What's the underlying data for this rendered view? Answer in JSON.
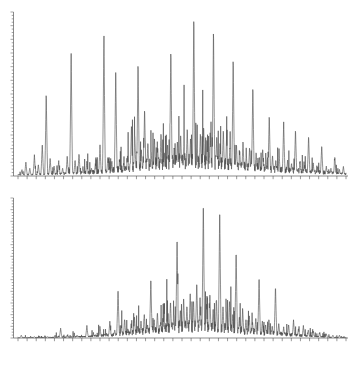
{
  "figure": {
    "kind": "stacked-mass-spectra",
    "panel_count": 2,
    "background_color": "#ffffff",
    "trace_color": "#4a4a4a",
    "axis_color": "#5a5a5a",
    "has_visible_text_labels": false,
    "caption": ""
  },
  "chart_data": [
    {
      "type": "line",
      "id": "top-spectrum",
      "title": "",
      "subtitle": "",
      "xlabel": "",
      "ylabel": "",
      "xlim": [
        0,
        100
      ],
      "ylim": [
        0,
        100
      ],
      "grid": false,
      "legend": [],
      "legend_position": "none",
      "axes": {
        "y_axis": {
          "visible": true,
          "position": "left",
          "style": "ticked-vertical-line",
          "minor_tick_count": 48,
          "tick_labels": []
        },
        "x_axis": {
          "visible": true,
          "position": "bottom",
          "style": "ticked-horizontal-line",
          "major_tick_count": 36,
          "tick_labels": []
        }
      },
      "annotations": [],
      "peaks": [
        {
          "x": 1.2,
          "y": 4
        },
        {
          "x": 2.4,
          "y": 9
        },
        {
          "x": 3.6,
          "y": 5
        },
        {
          "x": 5.0,
          "y": 13
        },
        {
          "x": 6.2,
          "y": 7
        },
        {
          "x": 7.4,
          "y": 20
        },
        {
          "x": 8.6,
          "y": 52
        },
        {
          "x": 9.8,
          "y": 11
        },
        {
          "x": 11.0,
          "y": 6
        },
        {
          "x": 12.4,
          "y": 9
        },
        {
          "x": 13.6,
          "y": 5
        },
        {
          "x": 15.0,
          "y": 12
        },
        {
          "x": 16.2,
          "y": 77
        },
        {
          "x": 17.4,
          "y": 10
        },
        {
          "x": 18.6,
          "y": 14
        },
        {
          "x": 19.8,
          "y": 6
        },
        {
          "x": 21.0,
          "y": 9
        },
        {
          "x": 22.4,
          "y": 5
        },
        {
          "x": 23.6,
          "y": 8
        },
        {
          "x": 25.0,
          "y": 19
        },
        {
          "x": 26.2,
          "y": 88
        },
        {
          "x": 27.4,
          "y": 12
        },
        {
          "x": 28.6,
          "y": 9
        },
        {
          "x": 29.8,
          "y": 65
        },
        {
          "x": 31.0,
          "y": 10
        },
        {
          "x": 32.2,
          "y": 8
        },
        {
          "x": 33.4,
          "y": 13
        },
        {
          "x": 34.6,
          "y": 32
        },
        {
          "x": 35.6,
          "y": 26
        },
        {
          "x": 36.6,
          "y": 71
        },
        {
          "x": 37.6,
          "y": 17
        },
        {
          "x": 38.6,
          "y": 42
        },
        {
          "x": 39.6,
          "y": 21
        },
        {
          "x": 40.6,
          "y": 16
        },
        {
          "x": 41.6,
          "y": 24
        },
        {
          "x": 42.6,
          "y": 18
        },
        {
          "x": 43.6,
          "y": 27
        },
        {
          "x": 44.6,
          "y": 15
        },
        {
          "x": 45.6,
          "y": 20
        },
        {
          "x": 46.6,
          "y": 79
        },
        {
          "x": 47.6,
          "y": 18
        },
        {
          "x": 48.6,
          "y": 22
        },
        {
          "x": 49.6,
          "y": 26
        },
        {
          "x": 50.6,
          "y": 19
        },
        {
          "x": 51.6,
          "y": 30
        },
        {
          "x": 52.6,
          "y": 24
        },
        {
          "x": 53.6,
          "y": 100
        },
        {
          "x": 54.6,
          "y": 22
        },
        {
          "x": 55.6,
          "y": 27
        },
        {
          "x": 56.6,
          "y": 31
        },
        {
          "x": 57.6,
          "y": 23
        },
        {
          "x": 58.6,
          "y": 28
        },
        {
          "x": 59.6,
          "y": 92
        },
        {
          "x": 60.6,
          "y": 25
        },
        {
          "x": 61.6,
          "y": 21
        },
        {
          "x": 62.6,
          "y": 29
        },
        {
          "x": 63.6,
          "y": 24
        },
        {
          "x": 64.6,
          "y": 18
        },
        {
          "x": 65.6,
          "y": 74
        },
        {
          "x": 66.6,
          "y": 20
        },
        {
          "x": 67.6,
          "y": 16
        },
        {
          "x": 68.6,
          "y": 22
        },
        {
          "x": 69.6,
          "y": 14
        },
        {
          "x": 70.6,
          "y": 18
        },
        {
          "x": 71.6,
          "y": 56
        },
        {
          "x": 72.6,
          "y": 15
        },
        {
          "x": 73.6,
          "y": 12
        },
        {
          "x": 74.6,
          "y": 17
        },
        {
          "x": 75.6,
          "y": 11
        },
        {
          "x": 76.6,
          "y": 38
        },
        {
          "x": 77.6,
          "y": 13
        },
        {
          "x": 78.6,
          "y": 10
        },
        {
          "x": 79.6,
          "y": 14
        },
        {
          "x": 81.0,
          "y": 33
        },
        {
          "x": 82.2,
          "y": 10
        },
        {
          "x": 83.4,
          "y": 8
        },
        {
          "x": 84.6,
          "y": 29
        },
        {
          "x": 86.0,
          "y": 9
        },
        {
          "x": 87.4,
          "y": 7
        },
        {
          "x": 88.6,
          "y": 25
        },
        {
          "x": 90.0,
          "y": 8
        },
        {
          "x": 91.4,
          "y": 6
        },
        {
          "x": 92.6,
          "y": 19
        },
        {
          "x": 94.0,
          "y": 6
        },
        {
          "x": 95.4,
          "y": 5
        },
        {
          "x": 96.6,
          "y": 12
        },
        {
          "x": 98.0,
          "y": 4
        },
        {
          "x": 99.2,
          "y": 6
        }
      ],
      "baseline_envelope": [
        {
          "x": 0,
          "y": 1
        },
        {
          "x": 10,
          "y": 2
        },
        {
          "x": 20,
          "y": 3
        },
        {
          "x": 30,
          "y": 6
        },
        {
          "x": 40,
          "y": 11
        },
        {
          "x": 50,
          "y": 14
        },
        {
          "x": 60,
          "y": 13
        },
        {
          "x": 70,
          "y": 9
        },
        {
          "x": 80,
          "y": 6
        },
        {
          "x": 90,
          "y": 4
        },
        {
          "x": 100,
          "y": 2
        }
      ]
    },
    {
      "type": "line",
      "id": "bottom-spectrum",
      "title": "",
      "subtitle": "",
      "xlabel": "",
      "ylabel": "",
      "xlim": [
        0,
        100
      ],
      "ylim": [
        0,
        100
      ],
      "grid": false,
      "legend": [],
      "legend_position": "none",
      "axes": {
        "y_axis": {
          "visible": true,
          "position": "left",
          "style": "ticked-vertical-line",
          "minor_tick_count": 48,
          "tick_labels": []
        },
        "x_axis": {
          "visible": true,
          "position": "bottom",
          "style": "ticked-horizontal-line",
          "major_tick_count": 36,
          "tick_labels": []
        }
      },
      "annotations": [],
      "peaks": [
        {
          "x": 1.0,
          "y": 2
        },
        {
          "x": 5.0,
          "y": 1
        },
        {
          "x": 9.0,
          "y": 1
        },
        {
          "x": 13.0,
          "y": 7
        },
        {
          "x": 15.0,
          "y": 2
        },
        {
          "x": 18.0,
          "y": 2
        },
        {
          "x": 21.0,
          "y": 9
        },
        {
          "x": 23.0,
          "y": 3
        },
        {
          "x": 25.0,
          "y": 8
        },
        {
          "x": 26.5,
          "y": 3
        },
        {
          "x": 28.0,
          "y": 12
        },
        {
          "x": 29.5,
          "y": 6
        },
        {
          "x": 30.5,
          "y": 36
        },
        {
          "x": 31.5,
          "y": 9
        },
        {
          "x": 32.5,
          "y": 14
        },
        {
          "x": 33.5,
          "y": 7
        },
        {
          "x": 34.5,
          "y": 11
        },
        {
          "x": 35.5,
          "y": 16
        },
        {
          "x": 36.5,
          "y": 9
        },
        {
          "x": 37.5,
          "y": 13
        },
        {
          "x": 38.5,
          "y": 18
        },
        {
          "x": 39.5,
          "y": 10
        },
        {
          "x": 40.5,
          "y": 44
        },
        {
          "x": 41.5,
          "y": 14
        },
        {
          "x": 42.5,
          "y": 19
        },
        {
          "x": 43.5,
          "y": 12
        },
        {
          "x": 44.5,
          "y": 22
        },
        {
          "x": 45.5,
          "y": 15
        },
        {
          "x": 46.5,
          "y": 27
        },
        {
          "x": 47.5,
          "y": 18
        },
        {
          "x": 48.5,
          "y": 74
        },
        {
          "x": 49.5,
          "y": 21
        },
        {
          "x": 50.5,
          "y": 30
        },
        {
          "x": 51.5,
          "y": 24
        },
        {
          "x": 52.5,
          "y": 34
        },
        {
          "x": 53.5,
          "y": 28
        },
        {
          "x": 54.5,
          "y": 41
        },
        {
          "x": 55.5,
          "y": 31
        },
        {
          "x": 56.5,
          "y": 100
        },
        {
          "x": 57.5,
          "y": 26
        },
        {
          "x": 58.5,
          "y": 33
        },
        {
          "x": 59.5,
          "y": 22
        },
        {
          "x": 60.5,
          "y": 29
        },
        {
          "x": 61.5,
          "y": 95
        },
        {
          "x": 62.5,
          "y": 24
        },
        {
          "x": 63.5,
          "y": 20
        },
        {
          "x": 64.5,
          "y": 28
        },
        {
          "x": 65.5,
          "y": 18
        },
        {
          "x": 66.5,
          "y": 64
        },
        {
          "x": 67.5,
          "y": 16
        },
        {
          "x": 68.5,
          "y": 21
        },
        {
          "x": 69.5,
          "y": 14
        },
        {
          "x": 70.5,
          "y": 17
        },
        {
          "x": 71.5,
          "y": 12
        },
        {
          "x": 72.5,
          "y": 15
        },
        {
          "x": 73.5,
          "y": 45
        },
        {
          "x": 74.5,
          "y": 13
        },
        {
          "x": 75.5,
          "y": 10
        },
        {
          "x": 76.5,
          "y": 14
        },
        {
          "x": 77.5,
          "y": 9
        },
        {
          "x": 78.5,
          "y": 38
        },
        {
          "x": 79.5,
          "y": 11
        },
        {
          "x": 81.0,
          "y": 8
        },
        {
          "x": 82.5,
          "y": 10
        },
        {
          "x": 84.0,
          "y": 13
        },
        {
          "x": 85.5,
          "y": 7
        },
        {
          "x": 87.0,
          "y": 9
        },
        {
          "x": 88.5,
          "y": 6
        },
        {
          "x": 90.0,
          "y": 5
        },
        {
          "x": 92.0,
          "y": 4
        },
        {
          "x": 94.0,
          "y": 3
        },
        {
          "x": 96.0,
          "y": 2
        },
        {
          "x": 98.0,
          "y": 2
        }
      ],
      "baseline_envelope": [
        {
          "x": 0,
          "y": 0.5
        },
        {
          "x": 10,
          "y": 0.8
        },
        {
          "x": 20,
          "y": 1.5
        },
        {
          "x": 30,
          "y": 4
        },
        {
          "x": 40,
          "y": 8
        },
        {
          "x": 50,
          "y": 13
        },
        {
          "x": 55,
          "y": 14
        },
        {
          "x": 65,
          "y": 10
        },
        {
          "x": 75,
          "y": 6
        },
        {
          "x": 85,
          "y": 3
        },
        {
          "x": 95,
          "y": 1
        },
        {
          "x": 100,
          "y": 0.5
        }
      ]
    }
  ]
}
